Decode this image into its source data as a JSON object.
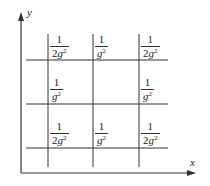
{
  "diagram": {
    "axes": {
      "x_label": "x",
      "y_label": "y"
    },
    "grid": {
      "rows": 3,
      "cols": 3,
      "line_color": "#333333"
    },
    "cells": [
      {
        "row": 0,
        "col": 0,
        "num": "1",
        "coef": "2",
        "var": "g",
        "exp": "2"
      },
      {
        "row": 0,
        "col": 1,
        "num": "1",
        "coef": "",
        "var": "g",
        "exp": "2"
      },
      {
        "row": 0,
        "col": 2,
        "num": "1",
        "coef": "2",
        "var": "g",
        "exp": "2"
      },
      {
        "row": 1,
        "col": 0,
        "num": "1",
        "coef": "",
        "var": "g",
        "exp": "2"
      },
      {
        "row": 1,
        "col": 1,
        "num": "",
        "coef": "",
        "var": "",
        "exp": ""
      },
      {
        "row": 1,
        "col": 2,
        "num": "1",
        "coef": "",
        "var": "g",
        "exp": "2"
      },
      {
        "row": 2,
        "col": 0,
        "num": "1",
        "coef": "2",
        "var": "g",
        "exp": "2"
      },
      {
        "row": 2,
        "col": 1,
        "num": "1",
        "coef": "",
        "var": "g",
        "exp": "2"
      },
      {
        "row": 2,
        "col": 2,
        "num": "1",
        "coef": "2",
        "var": "g",
        "exp": "2"
      }
    ]
  }
}
